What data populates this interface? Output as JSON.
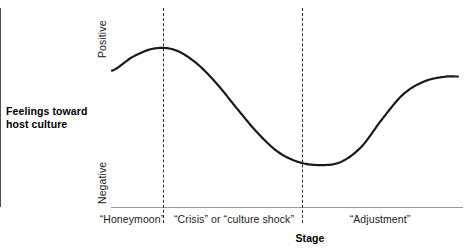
{
  "chart_data": {
    "type": "line",
    "title": "",
    "subtitle": "",
    "ylabel_line1": "Feelings toward",
    "ylabel_line2": "host culture",
    "xlabel": "Stage",
    "ytick_labels": [
      "Positive",
      "Negative"
    ],
    "ylim": [
      0,
      1
    ],
    "grid": false,
    "legend": "none",
    "annotations": [],
    "stage_labels": [
      "“Honeymoon”",
      "“Crisis” or “culture shock”",
      "“Adjustment”"
    ],
    "stage_divider_x": [
      0.149,
      0.546
    ],
    "series": [
      {
        "name": "Feelings toward host culture",
        "x": [
          0.0,
          0.06,
          0.12,
          0.18,
          0.24,
          0.3,
          0.36,
          0.42,
          0.48,
          0.54,
          0.6,
          0.66,
          0.72,
          0.78,
          0.84,
          0.9,
          0.96,
          1.0
        ],
        "y": [
          0.728,
          0.812,
          0.862,
          0.855,
          0.78,
          0.655,
          0.5,
          0.35,
          0.232,
          0.17,
          0.152,
          0.17,
          0.262,
          0.43,
          0.58,
          0.66,
          0.69,
          0.692
        ]
      }
    ],
    "colors": {
      "curve": "#1a1a1a",
      "y_axis": "#4d4d4d",
      "x_axis": "#9a9a9a",
      "divider": "#333333",
      "text": "#222222",
      "background": "#ffffff"
    }
  },
  "axis_titles": {
    "y_line1": "Feelings toward",
    "y_line2": "host culture",
    "x": "Stage"
  },
  "y_endpoints": {
    "top": "Positive",
    "bottom": "Negative"
  },
  "stages": [
    {
      "label": "“Honeymoon”"
    },
    {
      "label": "“Crisis” or “culture shock”"
    },
    {
      "label": "“Adjustment”"
    }
  ]
}
